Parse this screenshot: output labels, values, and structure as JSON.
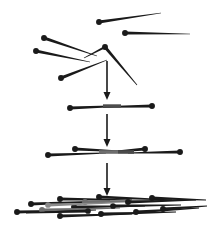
{
  "figure": {
    "width": 214,
    "height": 227,
    "background_color": "#ffffff",
    "ink_color": "#1a1a1a",
    "shade_color": "#7a7a7a",
    "stages": [
      {
        "name": "scattered-reads",
        "label": "unordered fragments",
        "description": "Seven unordered read fragments scattered across the upper region, each drawn as a tapered line with a filled round cap at its thicker end."
      },
      {
        "name": "contig-stage-1",
        "label": "first contig",
        "description": "Two overlapping fragments merged into a single short contig with a dark overlap band in the middle."
      },
      {
        "name": "contig-stage-2",
        "label": "second contig",
        "description": "Four overlapping fragments merged into a longer contig with two grey overlap bands."
      },
      {
        "name": "contig-stage-3",
        "label": "final assembly",
        "description": "Many overlapping fragments stacked into a dense wide assembly spanning the full width."
      }
    ],
    "arrows": [
      {
        "name": "arrow-1",
        "from_stage": "scattered-reads",
        "to_stage": "contig-stage-1",
        "direction": "down"
      },
      {
        "name": "arrow-2",
        "from_stage": "contig-stage-1",
        "to_stage": "contig-stage-2",
        "direction": "down"
      },
      {
        "name": "arrow-3",
        "from_stage": "contig-stage-2",
        "to_stage": "contig-stage-3",
        "direction": "down"
      }
    ]
  },
  "chart_data": {
    "type": "diagram",
    "xlabel": "",
    "ylabel": "",
    "xlim": [
      0,
      214
    ],
    "ylim": [
      0,
      227
    ],
    "grid": false,
    "legend": "none",
    "colors": {
      "ink": "#1a1a1a",
      "shade": "#7a7a7a",
      "light_shade": "#a8a8a8",
      "background": "#ffffff"
    },
    "series": [
      {
        "name": "scattered-reads",
        "kind": "segments",
        "count": 7,
        "segments": [
          {
            "id": "r1",
            "x1": 99,
            "y1": 22,
            "x2": 161,
            "y2": 13,
            "w1": 3.2,
            "w2": 0.7,
            "dot": "start",
            "color": "#1a1a1a"
          },
          {
            "id": "r2",
            "x1": 125,
            "y1": 33,
            "x2": 190,
            "y2": 34,
            "w1": 3.2,
            "w2": 0.7,
            "dot": "start",
            "color": "#1a1a1a"
          },
          {
            "id": "r3",
            "x1": 44,
            "y1": 38,
            "x2": 97,
            "y2": 56,
            "w1": 3.2,
            "w2": 0.7,
            "dot": "start",
            "color": "#1a1a1a"
          },
          {
            "id": "r4",
            "x1": 36,
            "y1": 51,
            "x2": 90,
            "y2": 62,
            "w1": 3.2,
            "w2": 0.7,
            "dot": "start",
            "color": "#1a1a1a"
          },
          {
            "id": "r5",
            "x1": 61,
            "y1": 78,
            "x2": 107,
            "y2": 60,
            "w1": 3.2,
            "w2": 0.7,
            "dot": "start",
            "color": "#1a1a1a"
          },
          {
            "id": "r6",
            "x1": 105,
            "y1": 47,
            "x2": 137,
            "y2": 85,
            "w1": 3.2,
            "w2": 0.7,
            "dot": "start",
            "color": "#1a1a1a"
          },
          {
            "id": "r7",
            "x1": 105,
            "y1": 47,
            "x2": 84,
            "y2": 58,
            "w1": 2.4,
            "w2": 0.7,
            "dot": "none",
            "color": "#1a1a1a"
          }
        ]
      },
      {
        "name": "contig-stage-1",
        "kind": "segments",
        "count": 2,
        "y_center": 108,
        "segments": [
          {
            "id": "c1a",
            "x1": 70,
            "y1": 108,
            "x2": 120,
            "y2": 106,
            "w1": 3.2,
            "w2": 1.4,
            "dot": "start",
            "color": "#1a1a1a"
          },
          {
            "id": "c1b",
            "x1": 152,
            "y1": 106,
            "x2": 103,
            "y2": 107,
            "w1": 3.2,
            "w2": 1.4,
            "dot": "start",
            "color": "#1a1a1a"
          },
          {
            "id": "c1overlap",
            "x1": 103,
            "y1": 106,
            "x2": 121,
            "y2": 106,
            "w1": 3.4,
            "w2": 3.4,
            "dot": "none",
            "color": "#4d4d4d"
          }
        ]
      },
      {
        "name": "contig-stage-2",
        "kind": "segments",
        "count": 4,
        "y_center": 155,
        "segments": [
          {
            "id": "c2a",
            "x1": 48,
            "y1": 155,
            "x2": 106,
            "y2": 153,
            "w1": 3.2,
            "w2": 1.2,
            "dot": "start",
            "color": "#1a1a1a"
          },
          {
            "id": "c2b",
            "x1": 75,
            "y1": 149,
            "x2": 133,
            "y2": 152,
            "w1": 3.2,
            "w2": 1.2,
            "dot": "start",
            "color": "#1a1a1a"
          },
          {
            "id": "c2c",
            "x1": 145,
            "y1": 149,
            "x2": 99,
            "y2": 153,
            "w1": 3.2,
            "w2": 1.2,
            "dot": "start",
            "color": "#1a1a1a"
          },
          {
            "id": "c2d",
            "x1": 180,
            "y1": 152,
            "x2": 128,
            "y2": 153,
            "w1": 3.2,
            "w2": 1.2,
            "dot": "start",
            "color": "#1a1a1a"
          },
          {
            "id": "c2ov1",
            "x1": 99,
            "y1": 152,
            "x2": 118,
            "y2": 152,
            "w1": 3.6,
            "w2": 3.6,
            "dot": "none",
            "color": "#6e6e6e"
          },
          {
            "id": "c2ov2",
            "x1": 118,
            "y1": 152,
            "x2": 134,
            "y2": 152,
            "w1": 3.6,
            "w2": 3.6,
            "dot": "none",
            "color": "#4a4a4a"
          }
        ]
      },
      {
        "name": "contig-stage-3",
        "kind": "segments",
        "count": 16,
        "y_center": 207,
        "segments": [
          {
            "id": "c3a",
            "x1": 31,
            "y1": 204,
            "x2": 110,
            "y2": 201,
            "w1": 3.2,
            "w2": 1.2,
            "dot": "start",
            "color": "#1a1a1a"
          },
          {
            "id": "c3b",
            "x1": 60,
            "y1": 199,
            "x2": 132,
            "y2": 200,
            "w1": 3.2,
            "w2": 1.2,
            "dot": "start",
            "color": "#1a1a1a"
          },
          {
            "id": "c3c",
            "x1": 85,
            "y1": 202,
            "x2": 160,
            "y2": 201,
            "w1": 3.2,
            "w2": 1.2,
            "dot": "start",
            "color": "#6e6e6e"
          },
          {
            "id": "c3d",
            "x1": 74,
            "y1": 207,
            "x2": 145,
            "y2": 206,
            "w1": 3.2,
            "w2": 1.2,
            "dot": "start",
            "color": "#1a1a1a"
          },
          {
            "id": "c3e",
            "x1": 99,
            "y1": 197,
            "x2": 172,
            "y2": 200,
            "w1": 3.2,
            "w2": 1.2,
            "dot": "start",
            "color": "#1a1a1a"
          },
          {
            "id": "c3f",
            "x1": 128,
            "y1": 202,
            "x2": 196,
            "y2": 200,
            "w1": 3.2,
            "w2": 1.2,
            "dot": "start",
            "color": "#1a1a1a"
          },
          {
            "id": "c3g",
            "x1": 152,
            "y1": 198,
            "x2": 206,
            "y2": 200,
            "w1": 3.2,
            "w2": 1.2,
            "dot": "start",
            "color": "#1a1a1a"
          },
          {
            "id": "c3h",
            "x1": 17,
            "y1": 212,
            "x2": 96,
            "y2": 210,
            "w1": 3.2,
            "w2": 1.2,
            "dot": "start",
            "color": "#1a1a1a"
          },
          {
            "id": "c3i",
            "x1": 42,
            "y1": 210,
            "x2": 120,
            "y2": 208,
            "w1": 3.2,
            "w2": 1.2,
            "dot": "start",
            "color": "#6e6e6e"
          },
          {
            "id": "c3j",
            "x1": 60,
            "y1": 216,
            "x2": 132,
            "y2": 214,
            "w1": 3.2,
            "w2": 1.2,
            "dot": "start",
            "color": "#1a1a1a"
          },
          {
            "id": "c3k",
            "x1": 101,
            "y1": 214,
            "x2": 176,
            "y2": 212,
            "w1": 3.2,
            "w2": 1.2,
            "dot": "start",
            "color": "#1a1a1a"
          },
          {
            "id": "c3l",
            "x1": 136,
            "y1": 212,
            "x2": 199,
            "y2": 208,
            "w1": 3.2,
            "w2": 1.2,
            "dot": "start",
            "color": "#1a1a1a"
          },
          {
            "id": "c3m",
            "x1": 163,
            "y1": 209,
            "x2": 207,
            "y2": 206,
            "w1": 3.2,
            "w2": 1.2,
            "dot": "start",
            "color": "#1a1a1a"
          },
          {
            "id": "c3n",
            "x1": 113,
            "y1": 206,
            "x2": 181,
            "y2": 205,
            "w1": 3.0,
            "w2": 1.2,
            "dot": "start",
            "color": "#1a1a1a"
          },
          {
            "id": "c3o",
            "x1": 88,
            "y1": 211,
            "x2": 26,
            "y2": 213,
            "w1": 3.0,
            "w2": 1.2,
            "dot": "start",
            "color": "#1a1a1a"
          },
          {
            "id": "c3p",
            "x1": 48,
            "y1": 205,
            "x2": 112,
            "y2": 203,
            "w1": 3.0,
            "w2": 1.2,
            "dot": "start",
            "color": "#8a8a8a"
          }
        ]
      }
    ],
    "arrows": [
      {
        "id": "arrow-1",
        "x": 107,
        "y_start": 61,
        "y_end": 100,
        "width": 1.6,
        "head_w": 7,
        "head_h": 8,
        "color": "#1a1a1a"
      },
      {
        "id": "arrow-2",
        "x": 107,
        "y_start": 114,
        "y_end": 147,
        "width": 1.6,
        "head_w": 7,
        "head_h": 8,
        "color": "#1a1a1a"
      },
      {
        "id": "arrow-3",
        "x": 107,
        "y_start": 163,
        "y_end": 196,
        "width": 1.6,
        "head_w": 7,
        "head_h": 8,
        "color": "#1a1a1a"
      }
    ]
  }
}
